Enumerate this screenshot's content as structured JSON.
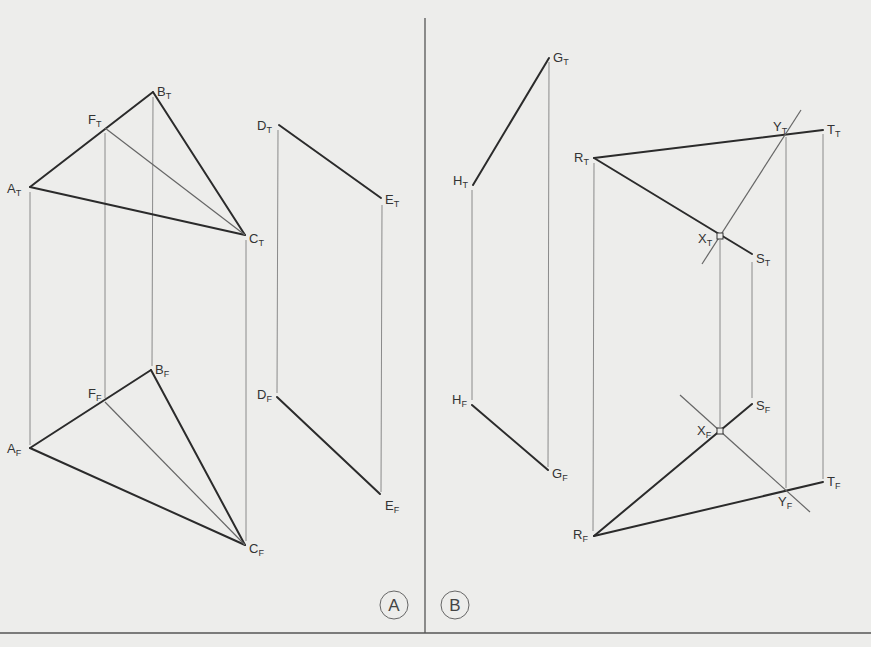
{
  "figure": {
    "panels": [
      {
        "id": "A",
        "label": "A"
      },
      {
        "id": "B",
        "label": "B"
      }
    ]
  },
  "labels": {
    "A_T": {
      "main": "A",
      "sub": "T"
    },
    "B_T": {
      "main": "B",
      "sub": "T"
    },
    "C_T": {
      "main": "C",
      "sub": "T"
    },
    "D_T": {
      "main": "D",
      "sub": "T"
    },
    "E_T": {
      "main": "E",
      "sub": "T"
    },
    "F_T": {
      "main": "F",
      "sub": "T"
    },
    "A_F": {
      "main": "A",
      "sub": "F"
    },
    "B_F": {
      "main": "B",
      "sub": "F"
    },
    "C_F": {
      "main": "C",
      "sub": "F"
    },
    "D_F": {
      "main": "D",
      "sub": "F"
    },
    "E_F": {
      "main": "E",
      "sub": "F"
    },
    "F_F": {
      "main": "F",
      "sub": "F"
    },
    "G_T": {
      "main": "G",
      "sub": "T"
    },
    "H_T": {
      "main": "H",
      "sub": "T"
    },
    "G_F": {
      "main": "G",
      "sub": "F"
    },
    "H_F": {
      "main": "H",
      "sub": "F"
    },
    "R_T": {
      "main": "R",
      "sub": "T"
    },
    "S_T": {
      "main": "S",
      "sub": "T"
    },
    "T_T": {
      "main": "T",
      "sub": "T"
    },
    "X_T": {
      "main": "X",
      "sub": "T"
    },
    "Y_T": {
      "main": "Y",
      "sub": "T"
    },
    "R_F": {
      "main": "R",
      "sub": "F"
    },
    "S_F": {
      "main": "S",
      "sub": "F"
    },
    "T_F": {
      "main": "T",
      "sub": "F"
    },
    "X_F": {
      "main": "X",
      "sub": "F"
    },
    "Y_F": {
      "main": "Y",
      "sub": "F"
    }
  },
  "colors": {
    "paper": "#ededeb",
    "ink": "#2b2b2b",
    "projector": "#8a8a8a"
  }
}
